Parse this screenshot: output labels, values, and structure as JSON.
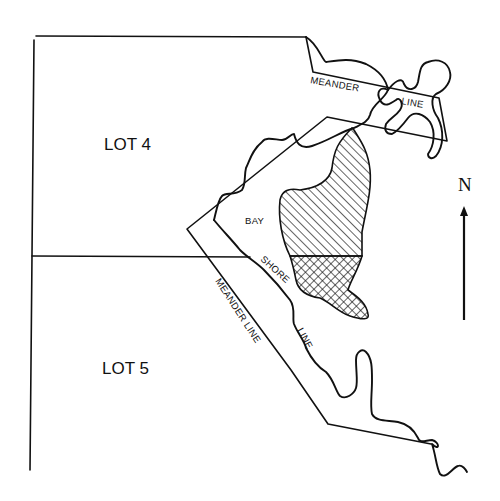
{
  "map": {
    "lots": [
      {
        "label": "LOT 4"
      },
      {
        "label": "LOT 5"
      }
    ],
    "labels": {
      "meander_top_1": "MEANDER",
      "meander_top_2": "LINE",
      "meander_diag": "MEANDER LINE",
      "bay": "BAY",
      "shore": "SHORE",
      "shore_line": "LINE"
    },
    "north_arrow": {
      "label": "N"
    },
    "colors": {
      "ink": "#111111",
      "background": "#ffffff"
    },
    "hatched_areas": [
      {
        "pattern": "diagonal-hatch"
      },
      {
        "pattern": "cross-hatch"
      }
    ]
  }
}
